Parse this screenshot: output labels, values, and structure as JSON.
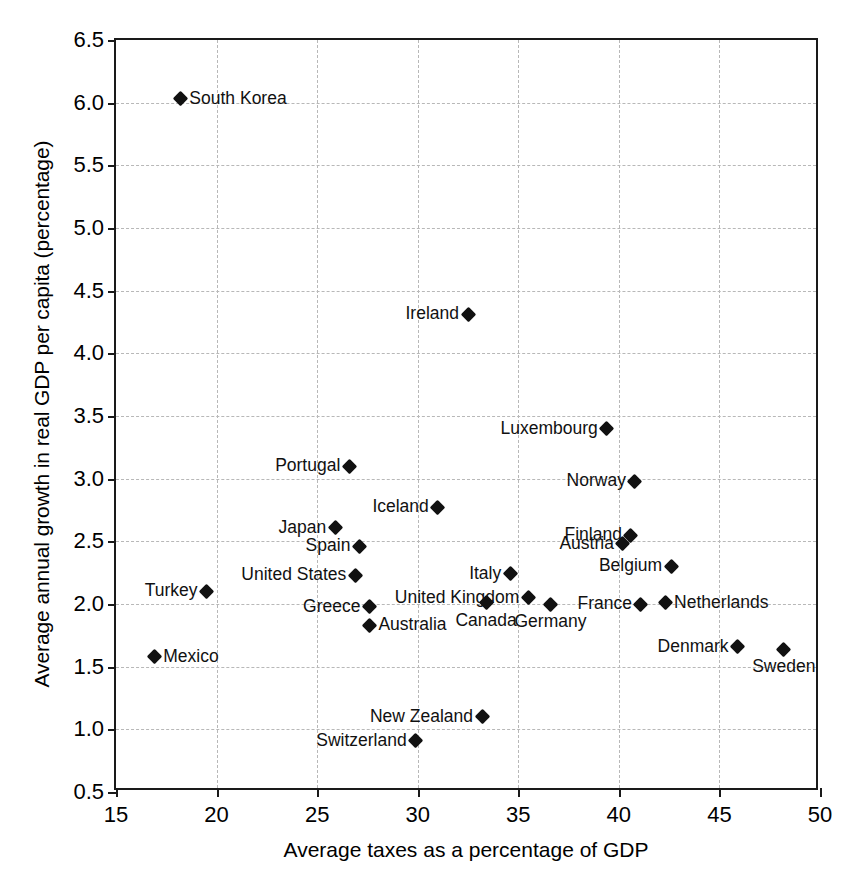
{
  "chart_data": {
    "type": "scatter",
    "title": "",
    "xlabel": "Average taxes as a percentage of GDP",
    "ylabel": "Average annual growth in real GDP per capita (percentage)",
    "xlim": [
      15,
      50
    ],
    "ylim": [
      0.5,
      6.5
    ],
    "xticks": [
      "15",
      "20",
      "25",
      "30",
      "35",
      "40",
      "45",
      "50"
    ],
    "yticks": [
      "0.5",
      "1.0",
      "1.5",
      "2.0",
      "2.5",
      "3.0",
      "3.5",
      "4.0",
      "4.5",
      "5.0",
      "5.5",
      "6.0",
      "6.5"
    ],
    "grid": true,
    "legend": "none",
    "marker_shape": "diamond",
    "marker_color": "#111111",
    "points": [
      {
        "label": "South Korea",
        "x": 18.2,
        "y": 6.03,
        "label_pos": "right"
      },
      {
        "label": "Ireland",
        "x": 32.5,
        "y": 4.31,
        "label_pos": "left"
      },
      {
        "label": "Luxembourg",
        "x": 39.4,
        "y": 3.4,
        "label_pos": "left"
      },
      {
        "label": "Portugal",
        "x": 26.6,
        "y": 3.1,
        "label_pos": "left"
      },
      {
        "label": "Norway",
        "x": 40.8,
        "y": 2.98,
        "label_pos": "left"
      },
      {
        "label": "Iceland",
        "x": 31.0,
        "y": 2.77,
        "label_pos": "left"
      },
      {
        "label": "Japan",
        "x": 25.9,
        "y": 2.61,
        "label_pos": "left"
      },
      {
        "label": "Finland",
        "x": 40.6,
        "y": 2.55,
        "label_pos": "left"
      },
      {
        "label": "Spain",
        "x": 27.1,
        "y": 2.46,
        "label_pos": "left"
      },
      {
        "label": "Austria",
        "x": 40.2,
        "y": 2.48,
        "label_pos": "left"
      },
      {
        "label": "Belgium",
        "x": 42.6,
        "y": 2.3,
        "label_pos": "left"
      },
      {
        "label": "Italy",
        "x": 34.6,
        "y": 2.24,
        "label_pos": "left"
      },
      {
        "label": "United States",
        "x": 26.9,
        "y": 2.23,
        "label_pos": "left"
      },
      {
        "label": "Turkey",
        "x": 19.5,
        "y": 2.1,
        "label_pos": "left"
      },
      {
        "label": "United Kingdom",
        "x": 35.5,
        "y": 2.05,
        "label_pos": "left"
      },
      {
        "label": "Netherlands",
        "x": 42.3,
        "y": 2.01,
        "label_pos": "right"
      },
      {
        "label": "Canada",
        "x": 33.4,
        "y": 2.01,
        "label_pos": "below"
      },
      {
        "label": "France",
        "x": 41.1,
        "y": 2.0,
        "label_pos": "left"
      },
      {
        "label": "Germany",
        "x": 36.6,
        "y": 2.0,
        "label_pos": "below"
      },
      {
        "label": "Greece",
        "x": 27.6,
        "y": 1.98,
        "label_pos": "left"
      },
      {
        "label": "Australia",
        "x": 27.6,
        "y": 1.83,
        "label_pos": "right"
      },
      {
        "label": "Denmark",
        "x": 45.9,
        "y": 1.66,
        "label_pos": "left"
      },
      {
        "label": "Sweden",
        "x": 48.2,
        "y": 1.64,
        "label_pos": "below"
      },
      {
        "label": "Mexico",
        "x": 16.9,
        "y": 1.58,
        "label_pos": "right"
      },
      {
        "label": "New Zealand",
        "x": 33.2,
        "y": 1.1,
        "label_pos": "left"
      },
      {
        "label": "Switzerland",
        "x": 29.9,
        "y": 0.91,
        "label_pos": "left"
      }
    ]
  }
}
